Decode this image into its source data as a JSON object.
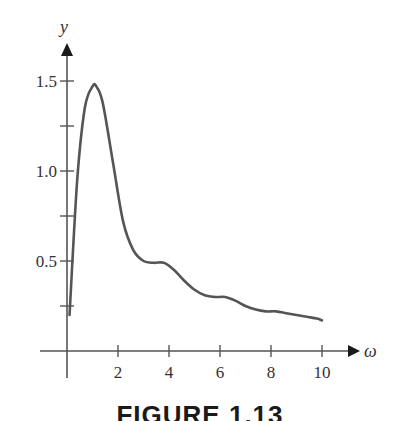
{
  "figure": {
    "caption": "FIGURE 1.13"
  },
  "chart_data": {
    "type": "line",
    "title": "",
    "xlabel": "ω",
    "ylabel": "y",
    "xlim": [
      0,
      10.8
    ],
    "ylim": [
      0,
      1.7
    ],
    "grid": false,
    "legend": null,
    "x_ticks": [
      2,
      4,
      6,
      8,
      10
    ],
    "x_tick_labels": [
      "2",
      "4",
      "6",
      "8",
      "10"
    ],
    "y_ticks": [
      0.25,
      0.5,
      0.75,
      1.0,
      1.25,
      1.5
    ],
    "y_tick_labels": [
      "",
      "0.5",
      "",
      "1.0",
      "",
      "1.5"
    ],
    "series": [
      {
        "name": "y(ω)",
        "color": "#555555",
        "x": [
          0.1,
          0.4,
          0.7,
          1.0,
          1.15,
          1.4,
          1.8,
          2.2,
          2.6,
          3.0,
          3.4,
          3.8,
          4.2,
          4.6,
          5.0,
          5.4,
          5.8,
          6.2,
          6.6,
          7.0,
          7.4,
          7.8,
          8.2,
          8.6,
          9.0,
          9.4,
          9.8,
          10.0
        ],
        "y": [
          0.2,
          0.95,
          1.35,
          1.47,
          1.47,
          1.38,
          1.05,
          0.72,
          0.56,
          0.5,
          0.49,
          0.49,
          0.45,
          0.39,
          0.34,
          0.31,
          0.3,
          0.3,
          0.28,
          0.25,
          0.23,
          0.22,
          0.22,
          0.21,
          0.2,
          0.19,
          0.18,
          0.17
        ]
      }
    ]
  }
}
